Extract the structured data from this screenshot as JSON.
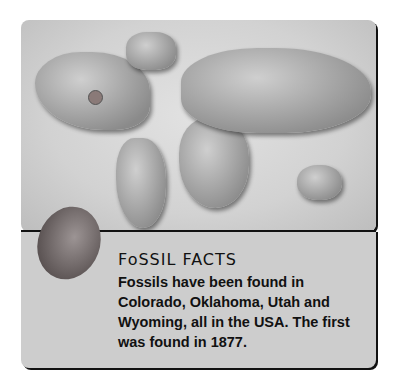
{
  "fact_box": {
    "title": "FoSSIL FACTS",
    "body": "Fossils have been found in Colorado, Oklahoma, Utah and Wyoming, all in the USA. The first was found in 1877."
  },
  "map": {
    "marker_icon": "location-dot",
    "marker_color": "#8a7a78"
  },
  "image": {
    "fossil_icon": "trilobite"
  }
}
